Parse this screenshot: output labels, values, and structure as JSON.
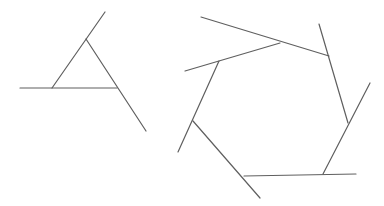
{
  "canvas": {
    "width": 384,
    "height": 206,
    "background": "#ffffff"
  },
  "style": {
    "stroke": "#5f5f5f",
    "stroke_width": 1.2
  },
  "figures": [
    {
      "name": "extended-triangle",
      "vertices": [
        [
          86,
          39
        ],
        [
          117,
          88
        ],
        [
          52,
          88
        ]
      ],
      "segments": [
        {
          "x1": 105,
          "y1": 12,
          "x2": 52,
          "y2": 88
        },
        {
          "x1": 86,
          "y1": 39,
          "x2": 146,
          "y2": 131
        },
        {
          "x1": 20,
          "y1": 88,
          "x2": 117,
          "y2": 88
        }
      ]
    },
    {
      "name": "extended-hexagon",
      "vertices": [
        [
          280,
          43
        ],
        [
          329,
          56
        ],
        [
          348,
          123
        ],
        [
          323,
          174
        ],
        [
          244,
          176
        ],
        [
          193,
          121
        ],
        [
          219,
          61
        ]
      ],
      "segments": [
        {
          "x1": 201,
          "y1": 17,
          "x2": 329,
          "y2": 56
        },
        {
          "x1": 319,
          "y1": 24,
          "x2": 348,
          "y2": 123
        },
        {
          "x1": 370,
          "y1": 83,
          "x2": 323,
          "y2": 174
        },
        {
          "x1": 356,
          "y1": 174,
          "x2": 244,
          "y2": 176
        },
        {
          "x1": 260,
          "y1": 198,
          "x2": 193,
          "y2": 121
        },
        {
          "x1": 178,
          "y1": 152,
          "x2": 219,
          "y2": 61
        },
        {
          "x1": 185,
          "y1": 71,
          "x2": 280,
          "y2": 43
        }
      ]
    }
  ]
}
